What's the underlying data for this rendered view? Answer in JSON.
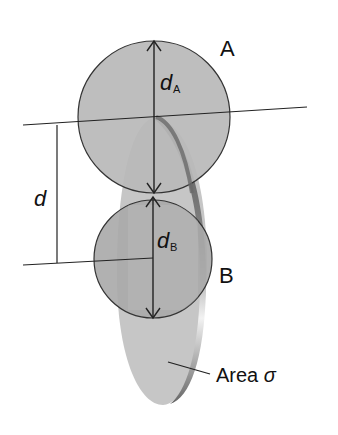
{
  "diagram": {
    "labels": {
      "sphere_a": "A",
      "sphere_b": "B",
      "diameter_a_main": "d",
      "diameter_a_sub": "A",
      "diameter_b_main": "d",
      "diameter_b_sub": "B",
      "separation": "d",
      "area_text": "Area ",
      "area_symbol": "σ"
    },
    "colors": {
      "sphere_fill": "#b4b4b4",
      "disk_fill": "#c4c4c4",
      "disk_edge": "#777777",
      "line": "#222222"
    }
  }
}
